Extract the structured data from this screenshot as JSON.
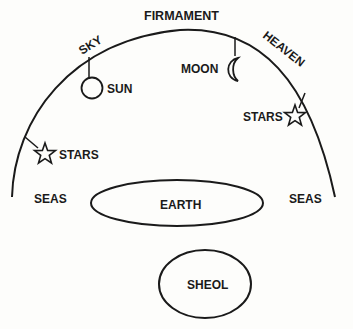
{
  "diagram": {
    "labels": {
      "firmament": "FIRMAMENT",
      "sky": "SKY",
      "heaven": "HEAVEN",
      "sun": "SUN",
      "moon": "MOON",
      "stars_right": "STARS",
      "stars_left": "STARS",
      "seas_left": "SEAS",
      "seas_right": "SEAS",
      "earth": "EARTH",
      "sheol": "SHEOL"
    },
    "colors": {
      "ink": "#1a1a1a",
      "paper": "#fdfdfb"
    }
  }
}
